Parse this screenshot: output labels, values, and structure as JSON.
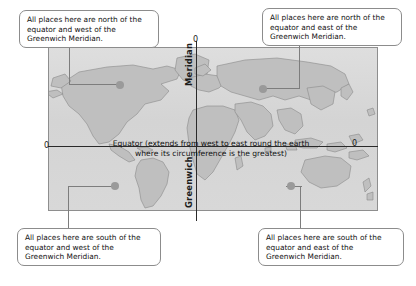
{
  "diagram": {
    "colors": {
      "ocean": "#d9d9d9",
      "land": "#bdbdbd",
      "line": "#2a2a2a",
      "callout_border": "#8c8c8c",
      "leader": "#7d7d7d",
      "dot": "#9a9a9a"
    }
  },
  "labels": {
    "equator_line1": "Equator (extends from west to east round the earth",
    "equator_line2": "where its circumference is the greatest)",
    "meridian_upper": "Meridian",
    "meridian_lower": "Greenwich",
    "zero_left": "0",
    "zero_right": "0",
    "zero_top": "0"
  },
  "callouts": [
    {
      "id": "north-west",
      "position": "top-left",
      "line1": "All places here are north of the",
      "line2": "equator and west of the",
      "line3": "Greenwich Meridian."
    },
    {
      "id": "north-east",
      "position": "top-right",
      "line1": "All places here are north of the",
      "line2": "equator and east of the",
      "line3": "Greenwich Meridian."
    },
    {
      "id": "south-west",
      "position": "bottom-left",
      "line1": "All places here are south of the",
      "line2": "equator and west of the",
      "line3": "Greenwich Meridian."
    },
    {
      "id": "south-east",
      "position": "bottom-right",
      "line1": "All places here are south of the",
      "line2": "equator and east of the",
      "line3": "Greenwich Meridian."
    }
  ]
}
